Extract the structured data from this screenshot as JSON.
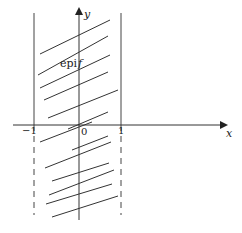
{
  "diagram": {
    "colors": {
      "background": "#ffffff",
      "line": "#333333",
      "axis": "#333333",
      "text": "#222222"
    },
    "axes": {
      "x_label": "x",
      "y_label": "y",
      "origin_label": "0",
      "tick_labels": [
        {
          "value": "−1",
          "name": "tick-label-minus-one"
        },
        {
          "value": "0",
          "name": "tick-label-zero"
        },
        {
          "value": "1",
          "name": "tick-label-one"
        }
      ]
    },
    "region_label": {
      "prefix": "epi",
      "symbol": "f"
    },
    "boundaries": {
      "left_x": -1,
      "right_x": 1,
      "above_axis_style": "solid",
      "below_axis_style": "dashed"
    },
    "hatching": {
      "description": "parallel diagonal segments filling the region between x=-1 and x=1",
      "count": 13
    }
  }
}
